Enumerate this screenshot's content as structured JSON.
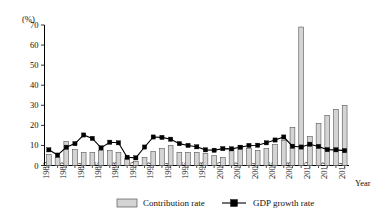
{
  "chart_data": {
    "type": "bar",
    "title": "",
    "xlabel": "Year",
    "ylabel": "(%)",
    "ylim": [
      0,
      70
    ],
    "yticks": [
      0,
      10,
      20,
      30,
      40,
      50,
      60,
      70
    ],
    "grid": false,
    "legend_position": "bottom",
    "x": [
      1980,
      1981,
      1982,
      1983,
      1984,
      1985,
      1986,
      1987,
      1988,
      1989,
      1990,
      1991,
      1992,
      1993,
      1994,
      1995,
      1996,
      1997,
      1998,
      1999,
      2000,
      2001,
      2002,
      2003,
      2004,
      2005,
      2006,
      2007,
      2008,
      2009,
      2010,
      2011,
      2012,
      2013,
      2014
    ],
    "categories": [
      "1980",
      "1981",
      "1982",
      "1983",
      "1984",
      "1985",
      "1986",
      "1987",
      "1988",
      "1989",
      "1990",
      "1991",
      "1992",
      "1993",
      "1994",
      "1995",
      "1996",
      "1997",
      "1998",
      "1999",
      "2000",
      "2001",
      "2002",
      "2003",
      "2004",
      "2005",
      "2006",
      "2007",
      "2008",
      "2009",
      "2010",
      "2011",
      "2012",
      "2013",
      "2014"
    ],
    "xtick_labels": [
      "1980",
      "1982",
      "1984",
      "1986",
      "1988",
      "1990",
      "1992",
      "1994",
      "1996",
      "1998",
      "2000",
      "2002",
      "2004",
      "2006",
      "2008",
      "2010",
      "2012",
      "2014"
    ],
    "series": [
      {
        "name": "Contribution rate",
        "type": "bar",
        "color": "#d4d4d4",
        "edge_color": "#555555",
        "values": [
          5.5,
          4.0,
          12.0,
          8.0,
          6.5,
          6.5,
          7.5,
          7.5,
          6.5,
          3.5,
          2.0,
          4.0,
          7.0,
          8.5,
          10.0,
          6.5,
          6.5,
          6.5,
          6.0,
          5.0,
          4.0,
          8.0,
          10.0,
          8.5,
          7.5,
          8.5,
          10.5,
          12.5,
          19.0,
          69.0,
          14.5,
          21.0,
          25.0,
          28.0,
          30.0
        ]
      },
      {
        "name": "GDP growth rate",
        "type": "line",
        "color": "#000000",
        "marker": "square",
        "values": [
          7.8,
          5.2,
          9.1,
          10.9,
          15.2,
          13.5,
          8.8,
          11.6,
          11.3,
          4.1,
          3.8,
          9.2,
          14.2,
          14.0,
          13.1,
          10.9,
          10.0,
          9.3,
          7.8,
          7.6,
          8.4,
          8.3,
          9.1,
          10.0,
          10.1,
          11.3,
          12.7,
          14.2,
          9.6,
          9.2,
          10.6,
          9.5,
          7.9,
          7.8,
          7.4
        ]
      }
    ]
  },
  "legend": {
    "items": [
      {
        "label": "Contribution rate",
        "kind": "bar-swatch"
      },
      {
        "label": "GDP growth rate",
        "kind": "line-marker"
      }
    ]
  },
  "axes": {
    "y_unit_label": "(%)",
    "x_title": "Year"
  }
}
